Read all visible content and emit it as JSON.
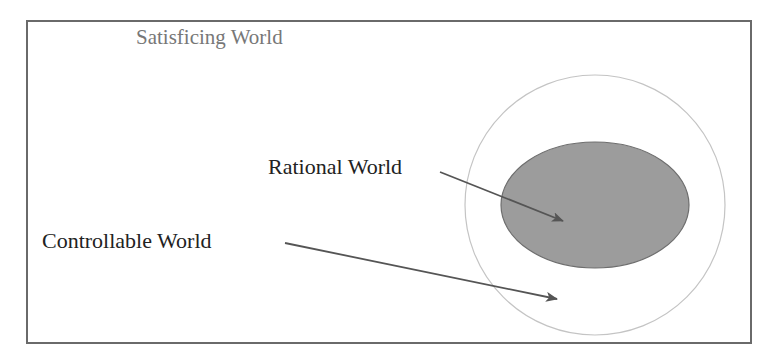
{
  "diagram": {
    "labels": {
      "outer": "Satisficing World",
      "inner": "Rational World",
      "middle": "Controllable World"
    },
    "colors": {
      "frame": "#6a6a6a",
      "circle_stroke": "#c0c0c0",
      "ellipse_fill": "#9a9a9a",
      "ellipse_stroke": "#6e6e6e",
      "arrow": "#555555",
      "outer_text": "#777777",
      "label_text": "#222222"
    }
  }
}
